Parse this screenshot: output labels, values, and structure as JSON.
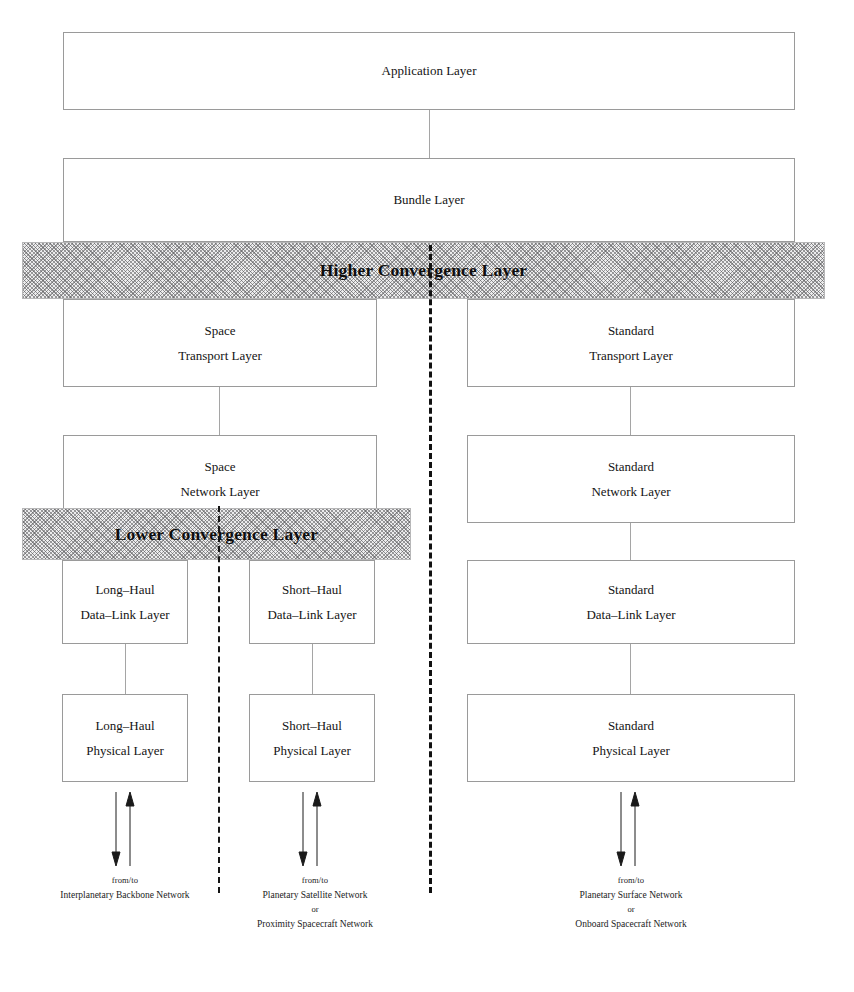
{
  "diagram": {
    "colors": {
      "box_border": "#9a9a9a",
      "band_fill": "#ececed",
      "band_hatch": "#5a5a5c",
      "divider": "#111111",
      "connector": "#a5a5a5",
      "text": "#141414"
    },
    "boxes": {
      "application": {
        "line1": "Application Layer",
        "line2": ""
      },
      "bundle": {
        "line1": "Bundle Layer",
        "line2": ""
      },
      "space_transport": {
        "line1": "Space",
        "line2": "Transport Layer"
      },
      "standard_transport": {
        "line1": "Standard",
        "line2": "Transport Layer"
      },
      "space_network": {
        "line1": "Space",
        "line2": "Network Layer"
      },
      "standard_network": {
        "line1": "Standard",
        "line2": "Network Layer"
      },
      "long_haul_datalink": {
        "line1": "Long–Haul",
        "line2": "Data–Link Layer"
      },
      "short_haul_datalink": {
        "line1": "Short–Haul",
        "line2": "Data–Link Layer"
      },
      "standard_datalink": {
        "line1": "Standard",
        "line2": "Data–Link Layer"
      },
      "long_haul_physical": {
        "line1": "Long–Haul",
        "line2": "Physical Layer"
      },
      "short_haul_physical": {
        "line1": "Short–Haul",
        "line2": "Physical Layer"
      },
      "standard_physical": {
        "line1": "Standard",
        "line2": "Physical Layer"
      }
    },
    "bands": {
      "higher_convergence": "Higher Convergence Layer",
      "lower_convergence": "Lower Convergence Layer"
    },
    "captions": {
      "long_haul": {
        "fromto": "from/to",
        "line1": "Interplanetary Backbone Network",
        "or": "",
        "line2": ""
      },
      "short_haul": {
        "fromto": "from/to",
        "line1": "Planetary Satellite Network",
        "or": "or",
        "line2": "Proximity Spacecraft Network"
      },
      "standard": {
        "fromto": "from/to",
        "line1": "Planetary Surface Network",
        "or": "or",
        "line2": "Onboard Spacecraft Network"
      }
    }
  }
}
